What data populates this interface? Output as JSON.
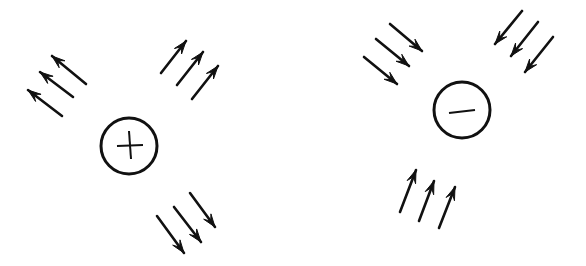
{
  "diagram": {
    "stroke_color": "#111111",
    "background": "#ffffff",
    "charges": [
      {
        "id": "positive",
        "sign": "+",
        "label": "positive-charge",
        "center": [
          129,
          146
        ],
        "radius": 28,
        "arrow_groups": [
          {
            "name": "upper-left",
            "direction": "away",
            "arrows": [
              [
                62,
                116,
                28,
                90
              ],
              [
                73,
                97,
                40,
                72
              ],
              [
                86,
                84,
                52,
                56
              ]
            ]
          },
          {
            "name": "upper-right",
            "direction": "away",
            "arrows": [
              [
                161,
                73,
                186,
                41
              ],
              [
                177,
                85,
                203,
                52
              ],
              [
                192,
                99,
                218,
                66
              ]
            ]
          },
          {
            "name": "bottom",
            "direction": "away",
            "arrows": [
              [
                157,
                216,
                184,
                253
              ],
              [
                174,
                207,
                201,
                242
              ],
              [
                190,
                193,
                215,
                227
              ]
            ]
          }
        ]
      },
      {
        "id": "negative",
        "sign": "−",
        "label": "negative-charge",
        "center": [
          462,
          110
        ],
        "radius": 28,
        "arrow_groups": [
          {
            "name": "upper-left",
            "direction": "toward",
            "arrows": [
              [
                364,
                57,
                397,
                84
              ],
              [
                376,
                39,
                409,
                66
              ],
              [
                390,
                24,
                422,
                51
              ]
            ]
          },
          {
            "name": "upper-right",
            "direction": "toward",
            "arrows": [
              [
                522,
                11,
                495,
                44
              ],
              [
                538,
                22,
                511,
                56
              ],
              [
                553,
                37,
                525,
                72
              ]
            ]
          },
          {
            "name": "bottom",
            "direction": "toward",
            "arrows": [
              [
                400,
                212,
                416,
                170
              ],
              [
                419,
                221,
                434,
                181
              ],
              [
                439,
                228,
                455,
                187
              ]
            ]
          }
        ]
      }
    ]
  }
}
